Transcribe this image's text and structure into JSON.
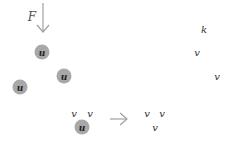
{
  "force": {
    "label": "F",
    "x": 32,
    "y": 17
  },
  "u_nodes": [
    {
      "label": "u",
      "x": 42,
      "y": 52
    },
    {
      "label": "u",
      "x": 64,
      "y": 76
    },
    {
      "label": "u",
      "x": 20,
      "y": 87
    },
    {
      "label": "u",
      "x": 82,
      "y": 127
    }
  ],
  "left_v": [
    {
      "label": "v",
      "x": 74,
      "y": 114
    },
    {
      "label": "v",
      "x": 90,
      "y": 114
    }
  ],
  "right_v": [
    {
      "label": "v",
      "x": 147,
      "y": 114
    },
    {
      "label": "v",
      "x": 162,
      "y": 114
    },
    {
      "label": "v",
      "x": 155,
      "y": 128
    },
    {
      "label": "v",
      "x": 197,
      "y": 53
    },
    {
      "label": "v",
      "x": 217,
      "y": 77
    }
  ],
  "k": {
    "label": "k",
    "x": 204,
    "y": 30
  },
  "colors": {
    "node": "#a8a8a8",
    "arrow": "#a0a0a0"
  }
}
